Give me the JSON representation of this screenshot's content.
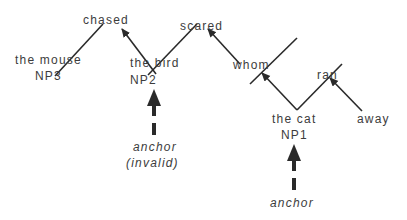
{
  "diagram": {
    "type": "dependency-anchor-diagram",
    "nodes": [
      {
        "id": "chased",
        "label": "chased"
      },
      {
        "id": "scared",
        "label": "scared"
      },
      {
        "id": "mouse",
        "label": "the mouse",
        "tag": "NP3"
      },
      {
        "id": "bird",
        "label": "the bird",
        "tag": "NP2"
      },
      {
        "id": "whom",
        "label": "whom"
      },
      {
        "id": "ran",
        "label": "ran"
      },
      {
        "id": "cat",
        "label": "the cat",
        "tag": "NP1"
      },
      {
        "id": "away",
        "label": "away"
      }
    ],
    "edges": [
      {
        "from": "mouse",
        "to": "chased",
        "arrow": false
      },
      {
        "from": "bird",
        "to": "chased",
        "arrow": true
      },
      {
        "from": "bird",
        "to": "scared",
        "arrow": false
      },
      {
        "from": "whom",
        "to": "scared",
        "arrow": true
      },
      {
        "from": "cat",
        "to": "whom",
        "arrow": true
      },
      {
        "from": "cat",
        "to": "ran",
        "arrow": false
      },
      {
        "from": "away",
        "to": "ran",
        "arrow": true
      }
    ],
    "anchors": [
      {
        "target": "NP2",
        "label": "anchor",
        "note": "(invalid)"
      },
      {
        "target": "NP1",
        "label": "anchor"
      }
    ],
    "stroke_color": "#2a2a2a"
  }
}
